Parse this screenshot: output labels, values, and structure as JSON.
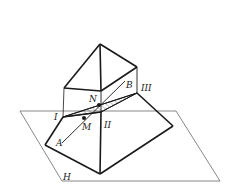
{
  "diagram": {
    "type": "geometry-3d-section",
    "labels": {
      "I": "I",
      "II": "II",
      "III": "III",
      "N": "N",
      "M": "M",
      "A": "A",
      "B": "B",
      "H": "H"
    },
    "colors": {
      "stroke": "#1a1a1a",
      "plane": "#555555",
      "hatch": "#444444"
    }
  }
}
